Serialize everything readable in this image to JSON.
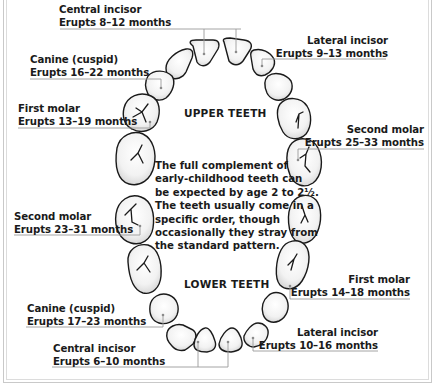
{
  "sections": {
    "upper": "UPPER TEETH",
    "lower": "LOWER TEETH"
  },
  "note": "The full complement of early-childhood teeth can be expected by age 2 to 2½. The teeth usually come in a specific order, though occasionally they stray from the standard pattern.",
  "upper_teeth": [
    {
      "name": "Central incisor",
      "erupts": "Erupts 8–12 months"
    },
    {
      "name": "Lateral incisor",
      "erupts": "Erupts 9–13 months"
    },
    {
      "name": "Canine (cuspid)",
      "erupts": "Erupts 16–22 months"
    },
    {
      "name": "First molar",
      "erupts": "Erupts 13–19 months"
    },
    {
      "name": "Second molar",
      "erupts": "Erupts 25–33 months"
    }
  ],
  "lower_teeth": [
    {
      "name": "Second molar",
      "erupts": "Erupts 23–31 months"
    },
    {
      "name": "First molar",
      "erupts": "Erupts 14–18 months"
    },
    {
      "name": "Canine (cuspid)",
      "erupts": "Erupts 17–23 months"
    },
    {
      "name": "Lateral incisor",
      "erupts": "Erupts 10–16 months"
    },
    {
      "name": "Central incisor",
      "erupts": "Erupts 6–10 months"
    }
  ],
  "colors": {
    "outline": "#1a1a1a",
    "leader": "#9a9a9a",
    "shade": "#e6e6e6"
  }
}
